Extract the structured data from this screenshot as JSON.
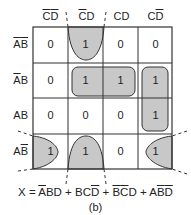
{
  "kmap": {
    "columns": [
      {
        "label": "C̄D̄",
        "parts": [
          {
            "t": "C",
            "bar": true
          },
          {
            "t": "D",
            "bar": true
          }
        ]
      },
      {
        "label": "C̄D",
        "parts": [
          {
            "t": "C",
            "bar": true
          },
          {
            "t": "D",
            "bar": false
          }
        ]
      },
      {
        "label": "CD",
        "parts": [
          {
            "t": "C",
            "bar": false
          },
          {
            "t": "D",
            "bar": false
          }
        ]
      },
      {
        "label": "CD̄",
        "parts": [
          {
            "t": "C",
            "bar": false
          },
          {
            "t": "D",
            "bar": true
          }
        ]
      }
    ],
    "rows": [
      {
        "label": "ĀB̄",
        "parts": [
          {
            "t": "A",
            "bar": true
          },
          {
            "t": "B",
            "bar": true
          }
        ]
      },
      {
        "label": "ĀB",
        "parts": [
          {
            "t": "A",
            "bar": true
          },
          {
            "t": "B",
            "bar": false
          }
        ]
      },
      {
        "label": "AB",
        "parts": [
          {
            "t": "A",
            "bar": false
          },
          {
            "t": "B",
            "bar": false
          }
        ]
      },
      {
        "label": "AB̄",
        "parts": [
          {
            "t": "A",
            "bar": false
          },
          {
            "t": "B",
            "bar": true
          }
        ]
      }
    ],
    "cells": [
      [
        "0",
        "1",
        "0",
        "0"
      ],
      [
        "0",
        "1",
        "1",
        "1"
      ],
      [
        "0",
        "0",
        "0",
        "1"
      ],
      [
        "1",
        "1",
        "0",
        "1"
      ]
    ],
    "groups": [
      {
        "name": "ĀBD",
        "cells": [
          [
            1,
            1
          ],
          [
            1,
            2
          ]
        ]
      },
      {
        "name": "BCD̄",
        "cells": [
          [
            1,
            3
          ],
          [
            2,
            3
          ]
        ]
      },
      {
        "name": "B̄C̄D",
        "cells": [
          [
            0,
            1
          ],
          [
            3,
            1
          ]
        ],
        "wraps": "vertical"
      },
      {
        "name": "AB̄D̄",
        "cells": [
          [
            3,
            0
          ],
          [
            3,
            3
          ]
        ],
        "wraps": "horizontal"
      }
    ],
    "group_fill": "#c8c8c8",
    "grid_color": "#333333"
  },
  "equation": {
    "lhs": "X",
    "terms": [
      [
        {
          "t": "A",
          "bar": true
        },
        {
          "t": "B",
          "bar": false
        },
        {
          "t": "D",
          "bar": false
        }
      ],
      [
        {
          "t": "B",
          "bar": false
        },
        {
          "t": "C",
          "bar": false
        },
        {
          "t": "D",
          "bar": true
        }
      ],
      [
        {
          "t": "B",
          "bar": true
        },
        {
          "t": "C",
          "bar": true
        },
        {
          "t": "D",
          "bar": false
        }
      ],
      [
        {
          "t": "A",
          "bar": false
        },
        {
          "t": "B",
          "bar": true
        },
        {
          "t": "D",
          "bar": true
        }
      ]
    ],
    "text": "X = ĀBD + BCD̄ + B̄C̄D + AB̄D̄"
  },
  "caption": "(b)"
}
